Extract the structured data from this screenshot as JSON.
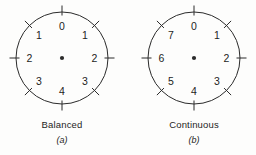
{
  "figure": {
    "background_color": "#fdfdfc",
    "stroke_color": "#2b2b2b",
    "text_color": "#1d1d1d"
  },
  "panels": [
    {
      "id": "balanced",
      "caption": "Balanced",
      "subcaption": "(a)",
      "center": {
        "x": 62,
        "y": 58
      },
      "radius": 46,
      "tick_count": 8,
      "labels": [
        "0",
        "1",
        "2",
        "3",
        "4",
        "3",
        "2",
        "1"
      ]
    },
    {
      "id": "continuous",
      "caption": "Continuous",
      "subcaption": "(b)",
      "center": {
        "x": 194,
        "y": 58
      },
      "radius": 46,
      "tick_count": 8,
      "labels": [
        "0",
        "1",
        "2",
        "3",
        "4",
        "5",
        "6",
        "7"
      ]
    }
  ],
  "chart_data": {
    "type": "diagram",
    "title": "",
    "series": [
      {
        "name": "Balanced",
        "categories": [
          0,
          45,
          90,
          135,
          180,
          225,
          270,
          315
        ],
        "values": [
          "0",
          "1",
          "2",
          "3",
          "4",
          "3",
          "2",
          "1"
        ]
      },
      {
        "name": "Continuous",
        "categories": [
          0,
          45,
          90,
          135,
          180,
          225,
          270,
          315
        ],
        "values": [
          "0",
          "1",
          "2",
          "3",
          "4",
          "5",
          "6",
          "7"
        ]
      }
    ]
  }
}
